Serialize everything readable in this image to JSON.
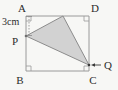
{
  "figure": {
    "background_color": "#f7f7f5",
    "stroke_color": "#9a9a9a",
    "label_color": "#2b2b2b",
    "shade_fill": "#d2d2d2",
    "shade_stroke": "#8c8c8c",
    "square": {
      "name": "ABCD",
      "vertices": [
        {
          "id": "A",
          "label": "A",
          "x": 26,
          "y": 16,
          "label_x": 22,
          "label_y": 12,
          "right_angle": true
        },
        {
          "id": "D",
          "label": "D",
          "x": 89,
          "y": 16,
          "label_x": 95,
          "label_y": 12,
          "right_angle": true
        },
        {
          "id": "C",
          "label": "C",
          "x": 89,
          "y": 71,
          "label_x": 93,
          "label_y": 84,
          "right_angle": true
        },
        {
          "id": "B",
          "label": "B",
          "x": 26,
          "y": 71,
          "label_x": 20,
          "label_y": 84,
          "right_angle": true
        }
      ]
    },
    "triangle": {
      "name": "P-apex-Q",
      "shaded": true,
      "vertices": [
        {
          "id": "P",
          "label": "P",
          "x": 26,
          "y": 36,
          "label_x": 15,
          "label_y": 45,
          "on_side": "AB"
        },
        {
          "id": "T",
          "label": "",
          "x": 63,
          "y": 16,
          "label_x": 63,
          "label_y": 12,
          "on_side": "AD"
        },
        {
          "id": "Q",
          "label": "Q",
          "x": 89,
          "y": 65,
          "label_x": 104,
          "label_y": 68,
          "on_side": "DC"
        }
      ]
    },
    "dimensions": [
      {
        "id": "AP",
        "text": "3cm",
        "text_x": 2,
        "text_y": 25,
        "from": {
          "x": 29,
          "y": 16
        },
        "to": {
          "x": 29,
          "y": 36
        },
        "style": "dotted"
      }
    ],
    "annotations": [
      {
        "id": "q-pointer",
        "type": "arrow",
        "label": "Q",
        "from": {
          "x": 101,
          "y": 65
        },
        "to": {
          "x": 91,
          "y": 65
        }
      }
    ]
  }
}
